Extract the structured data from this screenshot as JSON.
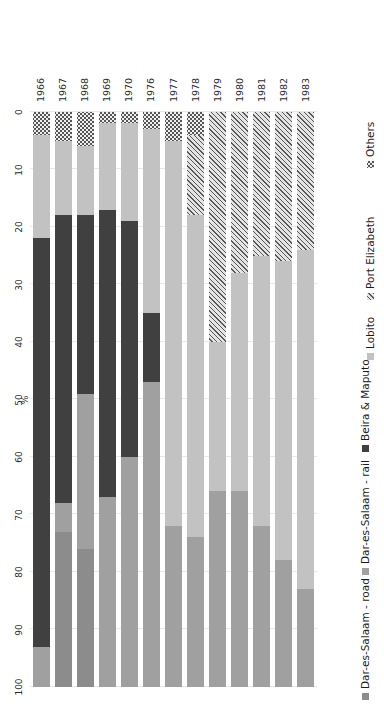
{
  "chart_data": {
    "type": "bar",
    "orientation": "horizontal-rotated",
    "stacked": true,
    "title": "",
    "xlabel": "%",
    "ylabel": "",
    "axis_label": "%",
    "xlim": [
      0,
      100
    ],
    "xticks": [
      100,
      90,
      80,
      70,
      60,
      50,
      40,
      30,
      20,
      10,
      0
    ],
    "xtick_labels": [
      "100",
      "90",
      "80",
      "70",
      "60",
      "50",
      "40",
      "30",
      "20",
      "10",
      "0"
    ],
    "axis_reversed": true,
    "grid": true,
    "legend_position": "right",
    "categories": [
      "1966",
      "1967",
      "1968",
      "1969",
      "1970",
      "1976",
      "1977",
      "1978",
      "1979",
      "1980",
      "1981",
      "1982",
      "1983"
    ],
    "series": [
      {
        "name": "Dar-es-Salaam - road",
        "color": "#8c8c8c",
        "pattern": "solid",
        "values": [
          0,
          27,
          24,
          0,
          0,
          0,
          0,
          0,
          0,
          0,
          0,
          0,
          0
        ]
      },
      {
        "name": "Dar-es-Salaam - rail",
        "color": "#a0a0a0",
        "pattern": "solid",
        "values": [
          7,
          5,
          27,
          33,
          40,
          53,
          28,
          26,
          34,
          34,
          28,
          22,
          17
        ]
      },
      {
        "name": "Beira & Maputo",
        "color": "#404040",
        "pattern": "solid",
        "values": [
          71,
          50,
          31,
          50,
          41,
          12,
          0,
          0,
          0,
          0,
          0,
          0,
          0
        ]
      },
      {
        "name": "Lobito",
        "color": "#c2c2c2",
        "pattern": "solid",
        "values": [
          18,
          13,
          12,
          15,
          17,
          32,
          67,
          56,
          26,
          38,
          47,
          52,
          59
        ]
      },
      {
        "name": "Port Elizabeth",
        "color": "#e4e4e4",
        "pattern": "diagonal-hatch",
        "values": [
          0,
          0,
          0,
          0,
          0,
          0,
          0,
          14,
          40,
          28,
          25,
          26,
          24
        ]
      },
      {
        "name": "Others",
        "color": "#eeeeee",
        "pattern": "dots",
        "values": [
          4,
          5,
          6,
          2,
          2,
          3,
          5,
          4,
          0,
          0,
          0,
          0,
          0
        ]
      }
    ]
  },
  "legend": {
    "items": [
      {
        "label": "Dar-es-Salaam - road",
        "swatch": "dsm-road"
      },
      {
        "label": "Dar-es-Salaam - rail",
        "swatch": "dsm-rail"
      },
      {
        "label": "Beira & Maputo",
        "swatch": "beira"
      },
      {
        "label": "Lobito",
        "swatch": "lobito"
      },
      {
        "label": "Port Elizabeth",
        "swatch": "pe"
      },
      {
        "label": "Others",
        "swatch": "others"
      }
    ]
  },
  "colors": {
    "dsm_road": "#8c8c8c",
    "dsm_rail": "#a0a0a0",
    "beira": "#404040",
    "lobito": "#c2c2c2",
    "port_elizabeth": "#e4e4e4",
    "others": "#eeeeee",
    "grid": "#e9e9e9",
    "text": "#2b2b2b",
    "background": "#ffffff"
  }
}
